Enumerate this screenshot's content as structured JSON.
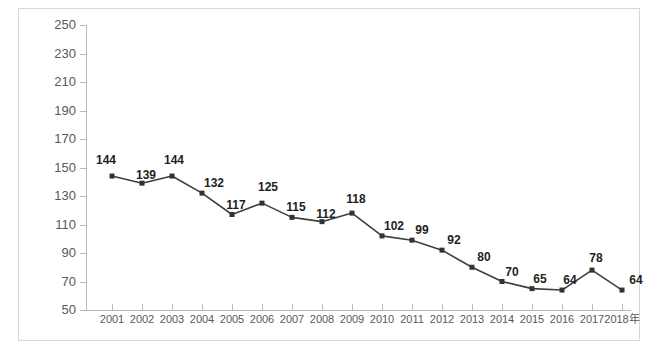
{
  "chart_data": {
    "type": "line",
    "title": "",
    "xlabel": "",
    "ylabel": "台风路径预报误差（km）",
    "categories": [
      "2001",
      "2002",
      "2003",
      "2004",
      "2005",
      "2006",
      "2007",
      "2008",
      "2009",
      "2010",
      "2011",
      "2012",
      "2013",
      "2014",
      "2015",
      "2016",
      "2017",
      "2018年"
    ],
    "values": [
      144,
      139,
      144,
      132,
      117,
      125,
      115,
      112,
      118,
      102,
      99,
      92,
      80,
      70,
      65,
      64,
      78,
      64
    ],
    "series": [
      {
        "name": "台风路径预报误差",
        "values": [
          144,
          139,
          144,
          132,
          117,
          125,
          115,
          112,
          118,
          102,
          99,
          92,
          80,
          70,
          65,
          64,
          78,
          64
        ]
      }
    ],
    "ylim": [
      50,
      250
    ],
    "ytick_step": 20,
    "yticks": [
      50,
      70,
      90,
      110,
      130,
      150,
      170,
      190,
      210,
      230,
      250
    ],
    "ytick_labels": [
      "50",
      "70",
      "90",
      "110",
      "130",
      "150",
      "170",
      "190",
      "210",
      "230",
      "250"
    ],
    "grid": false,
    "legend": false,
    "legend_position": "none",
    "data_labels_shown": true,
    "marker": "square",
    "colors": {
      "line": "#3f3f3f",
      "marker": "#333333",
      "data_label": "#231f20",
      "axis": "#b9b9b9",
      "tick_label": "#58595b",
      "frame_border": "#d8d8d8",
      "background": "#ffffff"
    }
  }
}
